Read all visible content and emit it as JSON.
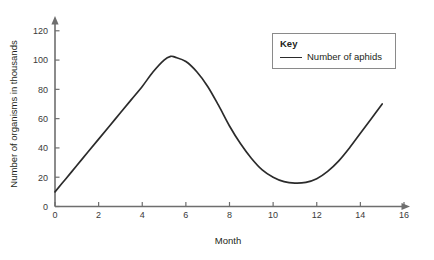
{
  "chart_data": {
    "type": "line",
    "title": "",
    "xlabel": "Month",
    "ylabel": "Number of organisms in thousands",
    "xlim": [
      0,
      16
    ],
    "ylim": [
      0,
      126
    ],
    "grid": false,
    "legend_position": "top-right",
    "x_ticks": [
      "0",
      "2",
      "4",
      "6",
      "8",
      "10",
      "12",
      "14",
      "16"
    ],
    "y_ticks": [
      "0",
      "20",
      "40",
      "60",
      "80",
      "100",
      "120"
    ],
    "series": [
      {
        "name": "Number of aphids",
        "color": "#2b2b2b",
        "x": [
          0,
          0.5,
          1,
          1.5,
          2,
          2.5,
          3,
          3.5,
          4,
          4.5,
          5,
          5.3,
          5.5,
          6,
          6.5,
          7,
          7.5,
          8,
          8.5,
          9,
          9.5,
          10,
          10.5,
          11,
          11.5,
          12,
          12.5,
          13,
          13.5,
          14,
          14.5,
          15
        ],
        "y": [
          10,
          19,
          28,
          37,
          46,
          55,
          64,
          73,
          82,
          92,
          100,
          102.5,
          102,
          99,
          92,
          82,
          69,
          55,
          43,
          33,
          25,
          20,
          17,
          16,
          16.5,
          19,
          24,
          31,
          40,
          50,
          60,
          70
        ]
      }
    ]
  },
  "legend": {
    "title": "Key",
    "entries": [
      {
        "label": "Number of aphids"
      }
    ]
  }
}
